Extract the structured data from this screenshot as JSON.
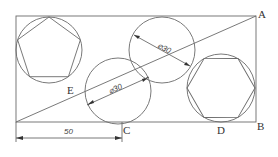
{
  "diagram": {
    "type": "geometry-construction",
    "points": {
      "A": "A",
      "B": "B",
      "C": "C",
      "D": "D",
      "E": "E"
    },
    "dimensions": {
      "width_label": "50",
      "upper_circle_diameter": "⌀30",
      "lower_circle_diameter": "⌀30"
    },
    "shapes": [
      {
        "name": "rectangle",
        "desc": "outer rectangle with diagonal"
      },
      {
        "name": "pentagon-in-circle",
        "desc": "regular pentagon inscribed in circle, top-left"
      },
      {
        "name": "circle-lower",
        "desc": "circle diameter 30 below diagonal"
      },
      {
        "name": "circle-upper",
        "desc": "circle diameter 30 above diagonal"
      },
      {
        "name": "hexagon-in-circle",
        "desc": "regular hexagon inscribed in circle, right"
      }
    ]
  }
}
